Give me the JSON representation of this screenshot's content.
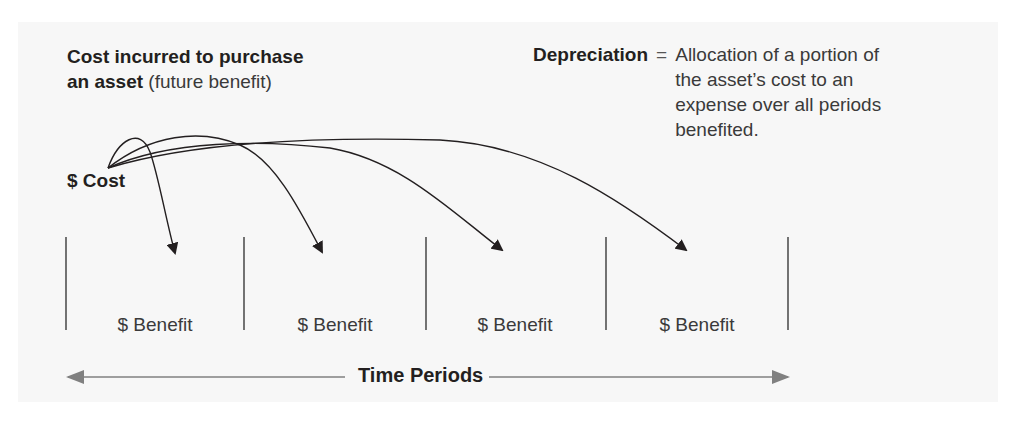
{
  "heading": {
    "bold_line1": "Cost incurred to purchase",
    "bold_line2": "an asset",
    "light_suffix": "(future benefit)"
  },
  "definition": {
    "term": "Depreciation",
    "equals": "=",
    "lines": [
      "Allocation of a portion of",
      "the asset’s cost to an",
      "expense over all periods",
      "benefited."
    ]
  },
  "cost": {
    "label": "$ Cost"
  },
  "periods": [
    {
      "label": "$ Benefit"
    },
    {
      "label": "$ Benefit"
    },
    {
      "label": "$ Benefit"
    },
    {
      "label": "$ Benefit"
    }
  ],
  "timeline": {
    "label": "Time Periods",
    "direction": "bidirectional"
  },
  "colors": {
    "text": "#231f20",
    "arrow": "#231f20",
    "timeline_arrow": "#808080",
    "panel": "#f7f7f7"
  }
}
